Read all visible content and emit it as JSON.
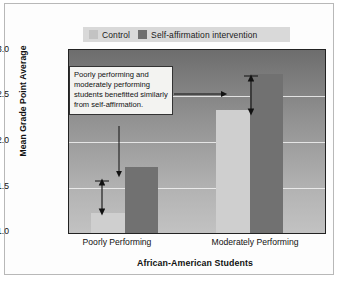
{
  "chart_data": {
    "type": "bar",
    "title": "",
    "subtitle": "",
    "xlabel": "African-American Students",
    "ylabel": "Mean Grade Point Average",
    "categories": [
      "Poorly Performing",
      "Moderately Performing"
    ],
    "series": [
      {
        "name": "Control",
        "color": "#cfcfcf",
        "values": [
          1.22,
          2.34
        ]
      },
      {
        "name": "Self-affirmation intervention",
        "color": "#717171",
        "values": [
          1.72,
          2.74
        ]
      }
    ],
    "ylim": [
      1.0,
      3.0
    ],
    "ytick_labels": [
      "1.0",
      "1.5",
      "2.0",
      "2.5",
      "3.0"
    ],
    "ytick_values": [
      1.0,
      1.5,
      2.0,
      2.5,
      3.0
    ],
    "grid": true,
    "legend_position": "top",
    "annotations": [
      {
        "name": "callout",
        "text": "Poorly performing and moderately performing students benefitted similarly from self-affirmation."
      },
      {
        "name": "gap-arrow-poorly",
        "from": 1.22,
        "to": 1.72
      },
      {
        "name": "gap-arrow-moderately",
        "from": 2.34,
        "to": 2.74
      }
    ]
  },
  "legend": {
    "items": [
      {
        "label": "Control",
        "swatch": "control-swatch"
      },
      {
        "label": "Self-affirmation intervention",
        "swatch": "intervention-swatch"
      }
    ]
  },
  "axes": {
    "y_title": "Mean Grade Point Average",
    "x_title": "African-American Students",
    "y_ticks": [
      "3.0",
      "2.5",
      "2.0",
      "1.5",
      "1.0"
    ],
    "x_ticks": [
      "Poorly Performing",
      "Moderately Performing"
    ]
  },
  "annotation": {
    "text": "Poorly performing and moderately performing students benefitted similarly from self-affirmation."
  },
  "colors": {
    "control_bar": "#cfcfcf",
    "intervention_bar": "#717171",
    "plot_background_top": "#6d6d6d",
    "plot_background_bottom": "#c2c2c2",
    "gridline": "#f2f2f2",
    "frame_border": "#b8b8b8",
    "annotation_background": "#f3f3f1"
  }
}
